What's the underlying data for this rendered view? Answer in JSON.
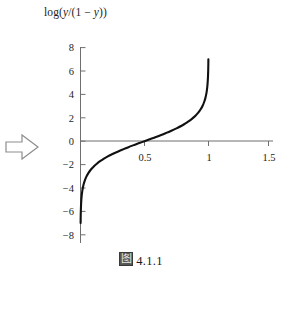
{
  "figure": {
    "background_color": "#ffffff",
    "axis_color": "#4a4a4a",
    "curve_color": "#111111",
    "text_color": "#1d1d1d",
    "arrow_color": "#8a8a8a",
    "axis_title_prefix": "log(",
    "axis_title_var1": "y",
    "axis_title_mid": "/(1 − ",
    "axis_title_var2": "y",
    "axis_title_suffix": "))",
    "axis_title_full": "log(y/(1 − y))",
    "caption_glyph": "图",
    "caption_text": "4.1.1",
    "pointer_arrow_name": "right-arrow"
  },
  "chart_data": {
    "type": "line",
    "title": "log(y/(1 − y))",
    "xlabel": "",
    "ylabel": "log(y/(1 − y))",
    "xlim": [
      -0.06,
      1.56
    ],
    "ylim": [
      -8,
      8
    ],
    "grid": false,
    "legend": null,
    "xticks": [
      0.5,
      1,
      1.5
    ],
    "xticklabels": [
      "0.5",
      "1",
      "1.5"
    ],
    "yticks": [
      8,
      6,
      4,
      2,
      0,
      -2,
      -4,
      -6,
      -8
    ],
    "yticklabels": [
      "8",
      "6",
      "4",
      "2",
      "0",
      "−2",
      "−4",
      "−6",
      "−8"
    ],
    "series": [
      {
        "name": "logit(y)",
        "formula": "log(y/(1-y))",
        "x": [
          0.00091,
          0.0015,
          0.0025,
          0.004,
          0.006,
          0.009,
          0.013,
          0.018,
          0.025,
          0.034,
          0.045,
          0.06,
          0.08,
          0.1,
          0.125,
          0.15,
          0.18,
          0.21,
          0.25,
          0.29,
          0.33,
          0.37,
          0.42,
          0.46,
          0.5,
          0.54,
          0.58,
          0.63,
          0.67,
          0.71,
          0.75,
          0.79,
          0.82,
          0.85,
          0.875,
          0.9,
          0.92,
          0.94,
          0.955,
          0.966,
          0.975,
          0.982,
          0.987,
          0.991,
          0.994,
          0.996,
          0.9975,
          0.9985,
          0.99909
        ],
        "y": [
          -7.0,
          -6.5,
          -5.99,
          -5.51,
          -5.11,
          -4.7,
          -4.33,
          -4.0,
          -3.66,
          -3.35,
          -3.05,
          -2.75,
          -2.44,
          -2.2,
          -1.95,
          -1.73,
          -1.52,
          -1.32,
          -1.1,
          -0.9,
          -0.71,
          -0.53,
          -0.32,
          -0.16,
          0.0,
          0.16,
          0.32,
          0.53,
          0.71,
          0.9,
          1.1,
          1.32,
          1.52,
          1.73,
          1.95,
          2.2,
          2.44,
          2.75,
          3.05,
          3.35,
          3.66,
          4.0,
          4.33,
          4.7,
          5.11,
          5.51,
          5.99,
          6.5,
          7.0
        ]
      }
    ],
    "annotations": [
      {
        "name": "caption",
        "text": "图 4.1.1"
      }
    ]
  }
}
